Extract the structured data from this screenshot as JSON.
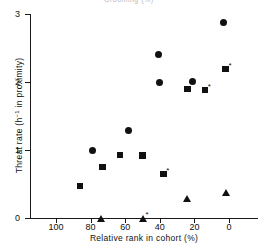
{
  "figure": {
    "caption_fragment": "Grooming (%)",
    "background_color": "#ffffff",
    "marker_color": "#111111"
  },
  "chart_data": {
    "type": "scatter",
    "title": "",
    "xlabel": "Relative rank in cohort (%)",
    "ylabel": "Threat rate (h⁻¹ in proximity)",
    "ylabel_plain": "Threat rate (h-1 in proximity)",
    "xlim": [
      115,
      0
    ],
    "ylim": [
      0,
      3
    ],
    "x_axis_reversed": true,
    "grid": false,
    "legend": null,
    "xticks": [
      100,
      80,
      60,
      40,
      20,
      0
    ],
    "xticklabels": [
      "100",
      "80",
      "60",
      "40",
      "20",
      "0"
    ],
    "yticks": [
      0,
      1,
      2,
      3
    ],
    "yticklabels": [
      "0",
      "1",
      "2",
      "3"
    ],
    "annotation_symbol": "*",
    "series": [
      {
        "name": "circle",
        "marker": "circle",
        "points": [
          {
            "x": 79,
            "y": 0.99
          },
          {
            "x": 58,
            "y": 1.28
          },
          {
            "x": 41,
            "y": 2.41
          },
          {
            "x": 40,
            "y": 2.0
          },
          {
            "x": 21,
            "y": 2.01
          },
          {
            "x": 3,
            "y": 2.88
          }
        ]
      },
      {
        "name": "square",
        "marker": "square",
        "points": [
          {
            "x": 86,
            "y": 0.47,
            "star": false
          },
          {
            "x": 73,
            "y": 0.75,
            "star": false
          },
          {
            "x": 63,
            "y": 0.93,
            "star": false
          },
          {
            "x": 50,
            "y": 0.92,
            "star": false
          },
          {
            "x": 38,
            "y": 0.65,
            "star": true
          },
          {
            "x": 24,
            "y": 1.9,
            "star": false
          },
          {
            "x": 14,
            "y": 1.88,
            "star": true
          },
          {
            "x": 2,
            "y": 2.19,
            "star": true
          }
        ]
      },
      {
        "name": "triangle",
        "marker": "triangle",
        "points": [
          {
            "x": 74,
            "y": 0.0,
            "star": false
          },
          {
            "x": 50,
            "y": 0.0,
            "star": true
          },
          {
            "x": 24,
            "y": 0.29,
            "star": false
          },
          {
            "x": 2,
            "y": 0.37,
            "star": false
          }
        ]
      }
    ]
  }
}
